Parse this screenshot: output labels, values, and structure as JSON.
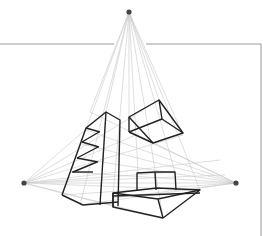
{
  "diagram": {
    "vanishing_points": [
      {
        "name": "top",
        "x": 129,
        "y": 12
      },
      {
        "name": "left",
        "x": 24,
        "y": 183
      },
      {
        "name": "right",
        "x": 236,
        "y": 183
      }
    ],
    "colors": {
      "guide": "#c8c8c8",
      "stroke": "#222222",
      "vp": "#444444",
      "frame": "#9a9a9a"
    },
    "shapes": [
      "tall-shelf-tower",
      "floating-box",
      "stepped-block"
    ]
  }
}
